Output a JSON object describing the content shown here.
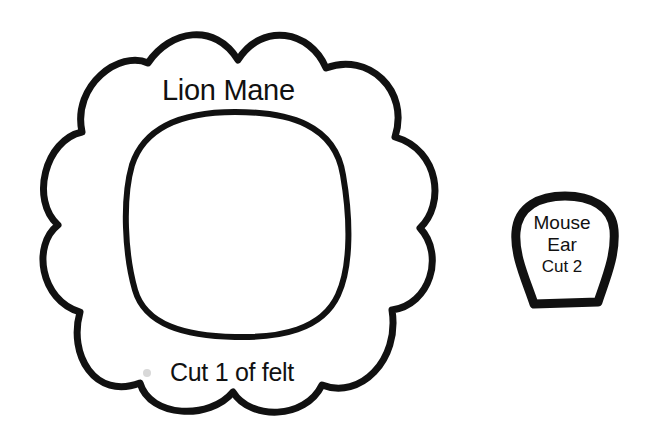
{
  "lion_mane": {
    "title": "Lion Mane",
    "instruction": "Cut 1 of felt"
  },
  "mouse_ear": {
    "line1": "Mouse",
    "line2": "Ear",
    "line3": "Cut 2"
  },
  "colors": {
    "outline": "#111111",
    "background": "#ffffff"
  }
}
